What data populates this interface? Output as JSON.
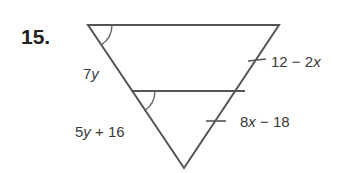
{
  "problem": {
    "number": "15."
  },
  "labels": {
    "left_upper": {
      "coef": "7",
      "var": "y"
    },
    "left_lower": {
      "coef": "5",
      "var": "y",
      "rest": " + 16"
    },
    "right_upper": {
      "pre": "12 − 2",
      "var": "x"
    },
    "right_lower": {
      "coef": "8",
      "var": "x",
      "rest": " − 18"
    }
  },
  "geometry": {
    "top_left": [
      88,
      25
    ],
    "top_right": [
      279,
      25
    ],
    "bottom": [
      184,
      168
    ],
    "mid_left": [
      131,
      91
    ],
    "mid_right": [
      245,
      91
    ]
  },
  "colors": {
    "line": "#555555",
    "text": "#3a3a3a",
    "number": "#222222"
  }
}
